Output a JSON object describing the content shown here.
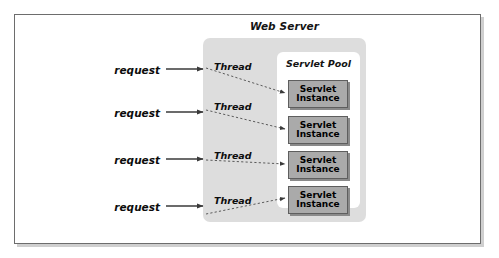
{
  "diagram": {
    "web_server": {
      "label": "Web Server",
      "background_color": "#dddddd"
    },
    "servlet_pool": {
      "label": "Servlet Pool",
      "background_color": "#ffffff",
      "instances": [
        {
          "line1": "Servlet",
          "line2": "Instance"
        },
        {
          "line1": "Servlet",
          "line2": "Instance"
        },
        {
          "line1": "Servlet",
          "line2": "Instance"
        },
        {
          "line1": "Servlet",
          "line2": "Instance"
        }
      ],
      "instance_color": "#aaaaaa"
    },
    "requests": [
      {
        "label": "request"
      },
      {
        "label": "request"
      },
      {
        "label": "request"
      },
      {
        "label": "request"
      }
    ],
    "threads": [
      {
        "label": "Thread"
      },
      {
        "label": "Thread"
      },
      {
        "label": "Thread"
      },
      {
        "label": "Thread"
      }
    ],
    "connectors": {
      "request_arrow_style": "solid",
      "thread_arrow_style": "dashed",
      "arrow_color": "#3a3a3a"
    },
    "frame": {
      "border_color": "#6d6d6d",
      "shadow_color": "#cfcfcf"
    }
  }
}
